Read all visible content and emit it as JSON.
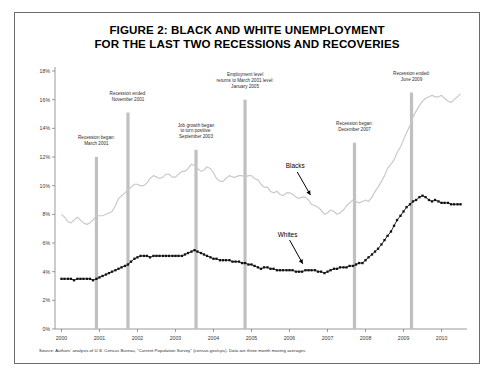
{
  "figure": {
    "title_line1": "FIGURE 2: BLACK AND WHITE UNEMPLOYMENT",
    "title_line2": "FOR THE LAST TWO RECESSIONS AND RECOVERIES",
    "source_note": "Source: Authors' analysis of U.S. Census Bureau, \"Current Population Survey\" (census.gov/cps). Data are three month moving averages."
  },
  "series_labels": {
    "blacks": "Blacks",
    "whites": "Whites"
  },
  "annotations": [
    {
      "id": "recession-began-2001",
      "lines": [
        "Recession began:",
        "March 2001"
      ],
      "x_year": 2000.92,
      "bar_top_pct": 12.0
    },
    {
      "id": "recession-ended-2001",
      "lines": [
        "Recession ended:",
        "November 2001"
      ],
      "x_year": 2001.75,
      "bar_top_pct": 15.1
    },
    {
      "id": "job-growth-positive-2003",
      "lines": [
        "Job growth began",
        "to turn positive:",
        "September 2003"
      ],
      "x_year": 2003.54,
      "bar_top_pct": 12.5
    },
    {
      "id": "employment-returns-2005",
      "lines": [
        "Employment level",
        "returns to March 2001 level:",
        "January 2005"
      ],
      "x_year": 2004.83,
      "bar_top_pct": 16.0
    },
    {
      "id": "recession-began-2007",
      "lines": [
        "Recession began:",
        "December 2007"
      ],
      "x_year": 2007.71,
      "bar_top_pct": 13.0
    },
    {
      "id": "recession-ended-2009",
      "lines": [
        "Recession ended:",
        "June 2009"
      ],
      "x_year": 2009.21,
      "bar_top_pct": 16.5
    }
  ],
  "colors": {
    "blacks_line": "#c8c8c8",
    "whites_line": "#111111",
    "marker_bar": "#c0c0c0",
    "axis": "#808080",
    "frame": "#6b6b6b",
    "text": "#2c2c2c"
  },
  "chart_data": {
    "type": "line",
    "title": "FIGURE 2: BLACK AND WHITE UNEMPLOYMENT FOR THE LAST TWO RECESSIONS AND RECOVERIES",
    "xlabel": "",
    "ylabel": "",
    "xlim": [
      1999.83,
      2010.67
    ],
    "ylim": [
      0,
      18
    ],
    "grid": false,
    "legend": "inline-annotations",
    "ytick_labels": [
      "0%",
      "2%",
      "4%",
      "6%",
      "8%",
      "10%",
      "12%",
      "14%",
      "16%",
      "18%"
    ],
    "ytick_values": [
      0,
      2,
      4,
      6,
      8,
      10,
      12,
      14,
      16,
      18
    ],
    "xtick_labels": [
      "2000",
      "2001",
      "2002",
      "2003",
      "2004",
      "2005",
      "2006",
      "2007",
      "2008",
      "2009",
      "2010"
    ],
    "xtick_values": [
      2000,
      2001,
      2002,
      2003,
      2004,
      2005,
      2006,
      2007,
      2008,
      2009,
      2010
    ],
    "x": [
      2000.0,
      2000.08,
      2000.17,
      2000.25,
      2000.33,
      2000.42,
      2000.5,
      2000.58,
      2000.67,
      2000.75,
      2000.83,
      2000.92,
      2001.0,
      2001.08,
      2001.17,
      2001.25,
      2001.33,
      2001.42,
      2001.5,
      2001.58,
      2001.67,
      2001.75,
      2001.83,
      2001.92,
      2002.0,
      2002.08,
      2002.17,
      2002.25,
      2002.33,
      2002.42,
      2002.5,
      2002.58,
      2002.67,
      2002.75,
      2002.83,
      2002.92,
      2003.0,
      2003.08,
      2003.17,
      2003.25,
      2003.33,
      2003.42,
      2003.5,
      2003.58,
      2003.67,
      2003.75,
      2003.83,
      2003.92,
      2004.0,
      2004.08,
      2004.17,
      2004.25,
      2004.33,
      2004.42,
      2004.5,
      2004.58,
      2004.67,
      2004.75,
      2004.83,
      2004.92,
      2005.0,
      2005.08,
      2005.17,
      2005.25,
      2005.33,
      2005.42,
      2005.5,
      2005.58,
      2005.67,
      2005.75,
      2005.83,
      2005.92,
      2006.0,
      2006.08,
      2006.17,
      2006.25,
      2006.33,
      2006.42,
      2006.5,
      2006.58,
      2006.67,
      2006.75,
      2006.83,
      2006.92,
      2007.0,
      2007.08,
      2007.17,
      2007.25,
      2007.33,
      2007.42,
      2007.5,
      2007.58,
      2007.67,
      2007.75,
      2007.83,
      2007.92,
      2008.0,
      2008.08,
      2008.17,
      2008.25,
      2008.33,
      2008.42,
      2008.5,
      2008.58,
      2008.67,
      2008.75,
      2008.83,
      2008.92,
      2009.0,
      2009.08,
      2009.17,
      2009.25,
      2009.33,
      2009.42,
      2009.5,
      2009.58,
      2009.67,
      2009.75,
      2009.83,
      2009.92,
      2010.0,
      2010.08,
      2010.17,
      2010.25,
      2010.33,
      2010.42,
      2010.5
    ],
    "series": [
      {
        "name": "Blacks",
        "color": "#c8c8c8",
        "style": "solid-thin",
        "values": [
          8.0,
          7.8,
          7.5,
          7.4,
          7.6,
          7.8,
          7.6,
          7.4,
          7.3,
          7.4,
          7.6,
          7.9,
          7.9,
          7.9,
          8.0,
          8.1,
          8.2,
          8.6,
          9.1,
          9.3,
          9.5,
          9.7,
          9.9,
          10.1,
          10.1,
          10.0,
          10.0,
          10.2,
          10.5,
          10.7,
          10.6,
          10.5,
          10.6,
          10.8,
          10.8,
          10.6,
          10.6,
          10.8,
          11.0,
          11.0,
          11.2,
          11.5,
          11.4,
          11.2,
          11.0,
          11.1,
          11.3,
          11.2,
          10.9,
          10.5,
          10.3,
          10.3,
          10.5,
          10.7,
          10.6,
          10.6,
          10.7,
          10.7,
          10.6,
          10.7,
          10.7,
          10.5,
          10.4,
          10.1,
          9.9,
          9.9,
          9.6,
          9.5,
          9.6,
          9.4,
          9.3,
          9.5,
          9.5,
          9.4,
          9.2,
          9.1,
          9.2,
          9.2,
          9.0,
          8.7,
          8.6,
          8.5,
          8.3,
          8.0,
          8.1,
          8.3,
          8.2,
          8.0,
          8.1,
          8.3,
          8.6,
          8.8,
          9.0,
          8.9,
          8.8,
          8.9,
          9.0,
          8.9,
          9.2,
          9.6,
          9.9,
          10.3,
          10.7,
          11.2,
          11.5,
          11.8,
          12.3,
          12.7,
          13.2,
          13.7,
          14.2,
          14.8,
          15.2,
          15.6,
          15.9,
          16.1,
          16.2,
          16.3,
          16.2,
          16.2,
          16.3,
          16.1,
          15.9,
          15.8,
          16.0,
          16.2,
          16.4
        ]
      },
      {
        "name": "Whites",
        "color": "#111111",
        "style": "dotted-thick",
        "values": [
          3.5,
          3.5,
          3.5,
          3.5,
          3.4,
          3.5,
          3.5,
          3.5,
          3.5,
          3.5,
          3.4,
          3.5,
          3.6,
          3.7,
          3.8,
          3.9,
          4.0,
          4.1,
          4.2,
          4.3,
          4.4,
          4.5,
          4.7,
          4.9,
          5.0,
          5.1,
          5.1,
          5.1,
          5.0,
          5.1,
          5.1,
          5.1,
          5.1,
          5.1,
          5.1,
          5.1,
          5.1,
          5.1,
          5.1,
          5.2,
          5.3,
          5.4,
          5.5,
          5.4,
          5.3,
          5.2,
          5.1,
          5.0,
          4.9,
          4.9,
          4.8,
          4.8,
          4.8,
          4.8,
          4.7,
          4.7,
          4.7,
          4.6,
          4.6,
          4.5,
          4.5,
          4.4,
          4.3,
          4.2,
          4.3,
          4.3,
          4.2,
          4.2,
          4.1,
          4.1,
          4.1,
          4.1,
          4.1,
          4.1,
          4.0,
          4.0,
          4.0,
          4.1,
          4.1,
          4.1,
          4.1,
          4.0,
          4.0,
          3.9,
          4.0,
          4.1,
          4.2,
          4.2,
          4.3,
          4.3,
          4.3,
          4.4,
          4.4,
          4.5,
          4.6,
          4.6,
          4.8,
          5.0,
          5.2,
          5.4,
          5.6,
          5.9,
          6.2,
          6.5,
          6.8,
          7.2,
          7.6,
          7.9,
          8.2,
          8.5,
          8.7,
          8.9,
          9.0,
          9.2,
          9.3,
          9.2,
          9.0,
          8.9,
          9.0,
          8.9,
          8.8,
          8.8,
          8.8,
          8.7,
          8.7,
          8.7,
          8.7
        ]
      }
    ]
  }
}
